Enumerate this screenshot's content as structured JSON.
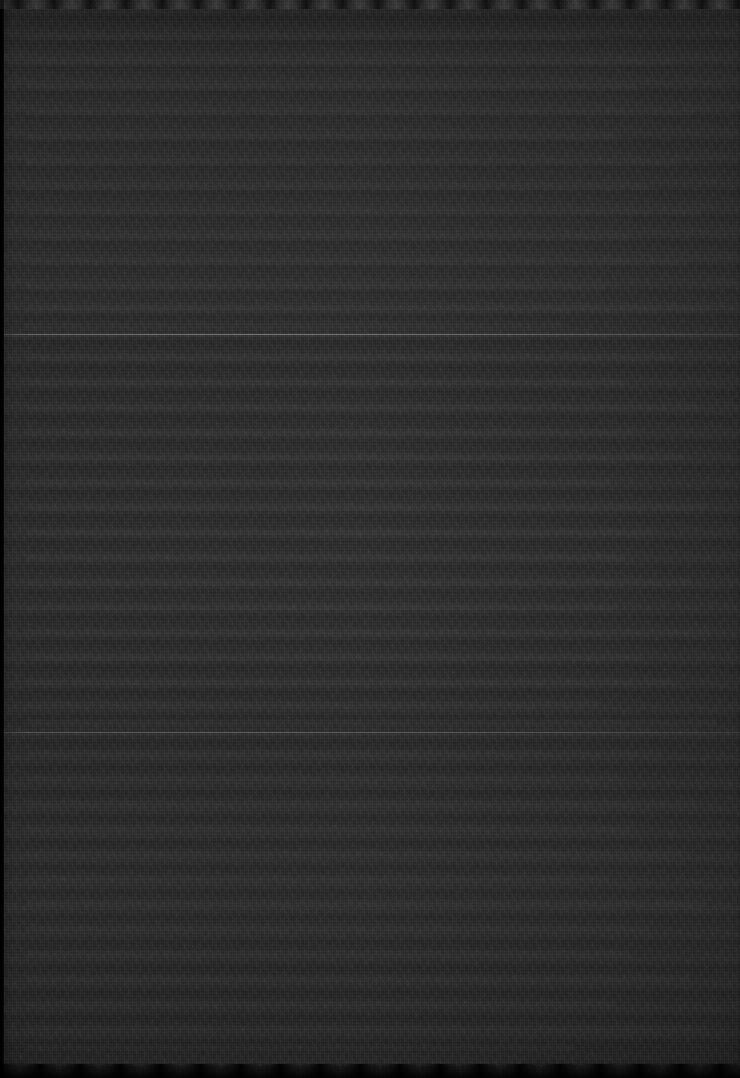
{
  "page": {
    "kind": "near-black-underexposed-scan",
    "width_px": 740,
    "height_px": 1078,
    "legible_text_present": false,
    "notes_label": "",
    "background_color": "#1b1b1b",
    "paper_tone_color": "#1e1e1e",
    "deepest_shadow_color": "#000000",
    "highlight_color": "#c4c4c4"
  },
  "structure": {
    "divider_count": 2,
    "dividers": [
      {
        "name": "divider-1",
        "y_px": 334,
        "thickness_px": 1,
        "color": "#c4c4c4",
        "opacity": 0.7,
        "spans_full_width": true
      },
      {
        "name": "divider-2",
        "y_px": 732,
        "thickness_px": 1,
        "color": "#c4c4c4",
        "opacity": 0.45,
        "spans_full_width": true
      }
    ],
    "left_gutter": {
      "name": "left-gutter",
      "x_px": 0,
      "width_px": 4,
      "color": "#000000"
    },
    "top_edge": {
      "name": "top-scan-edge",
      "height_px": 9,
      "pattern": "scalloped-light"
    },
    "bottom_edge": {
      "name": "bottom-scan-edge",
      "height_px": 14,
      "pattern": "scalloped-dark"
    }
  },
  "sections": [
    {
      "name": "section-top",
      "label": "",
      "top_px": 0,
      "height_px": 335,
      "row_band_count": 13,
      "rows": [
        "",
        "",
        "",
        "",
        "",
        "",
        "",
        "",
        "",
        "",
        "",
        "",
        ""
      ]
    },
    {
      "name": "section-middle",
      "label": "",
      "top_px": 336,
      "height_px": 397,
      "row_band_count": 16,
      "rows": [
        "",
        "",
        "",
        "",
        "",
        "",
        "",
        "",
        "",
        "",
        "",
        "",
        "",
        "",
        "",
        ""
      ]
    },
    {
      "name": "section-bottom",
      "label": "",
      "top_px": 734,
      "height_px": 344,
      "row_band_count": 14,
      "rows": [
        "",
        "",
        "",
        "",
        "",
        "",
        "",
        "",
        "",
        "",
        "",
        "",
        "",
        ""
      ]
    }
  ],
  "texture": {
    "type": "sensor-grain",
    "description": "",
    "banding_orientation": "horizontal",
    "band_period_px": 25,
    "grain_opacity": 0.85
  }
}
